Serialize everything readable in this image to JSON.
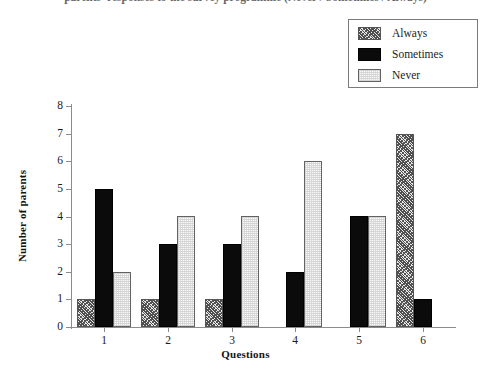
{
  "title": {
    "text": "parents' responses to the survey programme (Never / Sometimes / Always)"
  },
  "legend": {
    "position": "top-right",
    "entries": [
      {
        "label": "Always",
        "swatch": "hatch-diagonal"
      },
      {
        "label": "Sometimes",
        "swatch": "solid-black"
      },
      {
        "label": "Never",
        "swatch": "light-stipple"
      }
    ]
  },
  "axes": {
    "x": {
      "label": "Questions",
      "ticks": [
        "1",
        "2",
        "3",
        "4",
        "5",
        "6"
      ]
    },
    "y": {
      "label": "Number of parents",
      "ticks": [
        "0",
        "1",
        "2",
        "3",
        "4",
        "5",
        "6",
        "7",
        "8"
      ],
      "min": 0,
      "max": 8
    }
  },
  "colors": {
    "always": "#808080",
    "sometimes": "#0b0b0b",
    "never": "#f0f0f0",
    "axis": "#8c8c8c",
    "text": "#1c1c1c"
  },
  "chart_data": {
    "type": "bar",
    "title": "",
    "xlabel": "Questions",
    "ylabel": "Number of parents",
    "ylim": [
      0,
      8
    ],
    "grid": false,
    "legend_position": "top-right",
    "categories": [
      "1",
      "2",
      "3",
      "4",
      "5",
      "6"
    ],
    "series": [
      {
        "name": "Always",
        "values": [
          1,
          1,
          1,
          0,
          0,
          7
        ]
      },
      {
        "name": "Sometimes",
        "values": [
          5,
          3,
          3,
          2,
          4,
          1
        ]
      },
      {
        "name": "Never",
        "values": [
          2,
          4,
          4,
          6,
          4,
          0
        ]
      }
    ]
  }
}
